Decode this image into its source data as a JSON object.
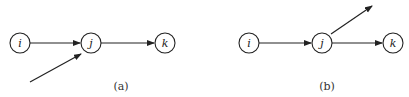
{
  "diagrams": [
    {
      "caption": "(a)",
      "nodes": [
        {
          "id": "i",
          "label": "i",
          "cx": 20,
          "cy": 43
        },
        {
          "id": "j",
          "label": "j",
          "cx": 91,
          "cy": 43
        },
        {
          "id": "k",
          "label": "k",
          "cx": 165,
          "cy": 43
        }
      ],
      "edges": [
        {
          "from": "i",
          "to": "j"
        },
        {
          "from": "j",
          "to": "k"
        },
        {
          "from": "external",
          "to": "j",
          "description": "incoming arrow from lower-left"
        }
      ]
    },
    {
      "caption": "(b)",
      "nodes": [
        {
          "id": "i",
          "label": "i",
          "cx": 249,
          "cy": 43
        },
        {
          "id": "j",
          "label": "j",
          "cx": 322,
          "cy": 43
        },
        {
          "id": "k",
          "label": "k",
          "cx": 393,
          "cy": 43
        }
      ],
      "edges": [
        {
          "from": "i",
          "to": "j"
        },
        {
          "from": "j",
          "to": "k"
        },
        {
          "from": "j",
          "to": "external",
          "description": "outgoing arrow to upper-right"
        }
      ]
    }
  ],
  "style": {
    "stroke_color": "#222222",
    "background": "#ffffff"
  }
}
